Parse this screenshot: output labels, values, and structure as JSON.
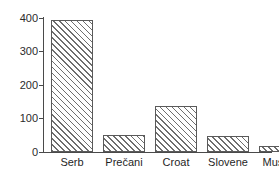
{
  "chart_data": {
    "type": "bar",
    "title": "",
    "subtitle": "",
    "xlabel": "",
    "ylabel": "",
    "categories": [
      "Serb",
      "Prečani",
      "Croat",
      "Slovene",
      "Muslim"
    ],
    "values": [
      395,
      51,
      137,
      48,
      18
    ],
    "ylim": [
      0,
      400
    ],
    "yticks": [
      0,
      100,
      200,
      300,
      400
    ],
    "ytick_labels": [
      "0",
      "100",
      "200",
      "300",
      "400"
    ],
    "grid": false,
    "legend": null,
    "series": [
      {
        "name": "count",
        "values": [
          395,
          51,
          137,
          48,
          18
        ]
      }
    ],
    "bar_style": {
      "fill": "diagonal-hatch",
      "hatch_color": "#6e6e6e",
      "background": "#ffffff",
      "edge_color": "#5a5a5a"
    },
    "axis_color": "#4a4a4a"
  },
  "bars": [
    {
      "label": "Serb",
      "value": 395,
      "left": 7,
      "width": 42
    },
    {
      "label": "Prečani",
      "value": 51,
      "left": 59,
      "width": 42
    },
    {
      "label": "Croat",
      "value": 137,
      "left": 111,
      "width": 42
    },
    {
      "label": "Slovene",
      "value": 48,
      "left": 163,
      "width": 42
    },
    {
      "label": "Muslim",
      "value": 18,
      "left": 215,
      "width": 42
    }
  ],
  "yticks": [
    {
      "label": "400",
      "value": 400
    },
    {
      "label": "300",
      "value": 300
    },
    {
      "label": "200",
      "value": 200
    },
    {
      "label": "100",
      "value": 100
    },
    {
      "label": "0",
      "value": 0
    }
  ]
}
